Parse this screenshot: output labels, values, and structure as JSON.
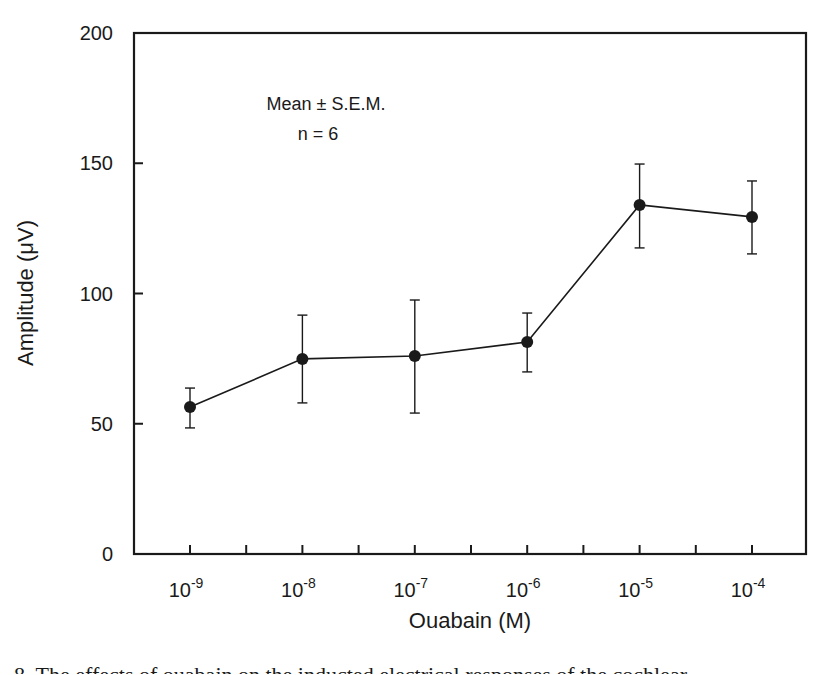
{
  "chart_data": {
    "type": "line",
    "title": "",
    "xlabel": "Ouabain (M)",
    "ylabel": "Amplitude (μV)",
    "x_scale": "log",
    "categories": [
      "10^-9",
      "10^-8",
      "10^-7",
      "10^-6",
      "10^-5",
      "10^-4"
    ],
    "x_tick_labels": [
      {
        "base": "10",
        "exp": "-9"
      },
      {
        "base": "10",
        "exp": "-8"
      },
      {
        "base": "10",
        "exp": "-7"
      },
      {
        "base": "10",
        "exp": "-6"
      },
      {
        "base": "10",
        "exp": "-5"
      },
      {
        "base": "10",
        "exp": "-4"
      }
    ],
    "y_ticks": [
      0,
      50,
      100,
      150,
      200
    ],
    "ylim": [
      0,
      200
    ],
    "grid": false,
    "legend": null,
    "annotations": [
      "Mean ± S.E.M.",
      "n = 6"
    ],
    "series": [
      {
        "name": "Amplitude",
        "marker": "filled-circle",
        "color": "#1a1a1a",
        "values": [
          56.4,
          74.9,
          76.0,
          81.4,
          134.0,
          129.4
        ],
        "error_upper": [
          63.7,
          91.7,
          97.5,
          92.5,
          149.7,
          143.2
        ],
        "error_lower": [
          48.4,
          58.0,
          54.1,
          69.9,
          117.5,
          115.2
        ]
      }
    ]
  },
  "figure": {
    "annotation_line1": "Mean ± S.E.M.",
    "annotation_line2": "n = 6",
    "xlabel": "Ouabain (M)",
    "ylabel": "Amplitude (μV)",
    "caption_fragment": "8. The effects of ouabain on the inducted electrical responses of the cochlear..."
  }
}
